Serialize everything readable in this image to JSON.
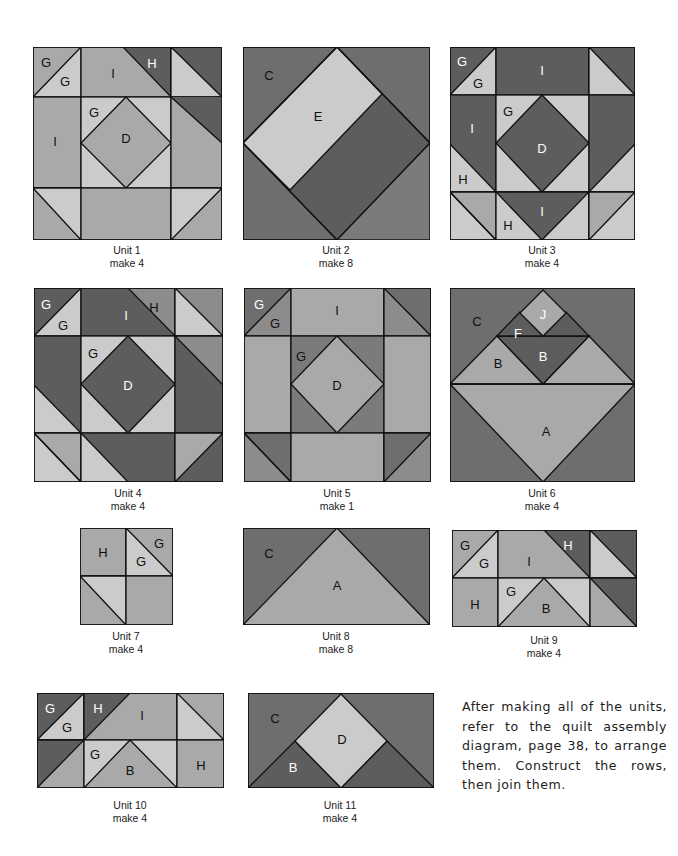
{
  "colors": {
    "light": "#cbcbcb",
    "medium": "#a9a9a9",
    "mid_dark": "#8c8c8c",
    "dark": "#5d5d5d",
    "outline": "#111111"
  },
  "units": [
    {
      "id": 1,
      "title": "Unit 1",
      "quantity": "make 4",
      "piece_labels": [
        "G",
        "G",
        "I",
        "H",
        "G",
        "I",
        "D"
      ]
    },
    {
      "id": 2,
      "title": "Unit 2",
      "quantity": "make 8",
      "piece_labels": [
        "C",
        "E"
      ]
    },
    {
      "id": 3,
      "title": "Unit 3",
      "quantity": "make 4",
      "piece_labels": [
        "G",
        "G",
        "I",
        "G",
        "I",
        "D",
        "H",
        "H",
        "I"
      ]
    },
    {
      "id": 4,
      "title": "Unit 4",
      "quantity": "make 4",
      "piece_labels": [
        "G",
        "G",
        "I",
        "H",
        "G",
        "D"
      ]
    },
    {
      "id": 5,
      "title": "Unit 5",
      "quantity": "make 1",
      "piece_labels": [
        "G",
        "G",
        "I",
        "G",
        "D"
      ]
    },
    {
      "id": 6,
      "title": "Unit 6",
      "quantity": "make 4",
      "piece_labels": [
        "C",
        "J",
        "F",
        "B",
        "B",
        "A"
      ]
    },
    {
      "id": 7,
      "title": "Unit 7",
      "quantity": "make 4",
      "piece_labels": [
        "H",
        "G",
        "G"
      ]
    },
    {
      "id": 8,
      "title": "Unit 8",
      "quantity": "make 8",
      "piece_labels": [
        "C",
        "A"
      ]
    },
    {
      "id": 9,
      "title": "Unit 9",
      "quantity": "make 4",
      "piece_labels": [
        "G",
        "G",
        "I",
        "H",
        "H",
        "G",
        "B"
      ]
    },
    {
      "id": 10,
      "title": "Unit 10",
      "quantity": "make 4",
      "piece_labels": [
        "G",
        "G",
        "H",
        "I",
        "G",
        "B",
        "H"
      ]
    },
    {
      "id": 11,
      "title": "Unit 11",
      "quantity": "make 4",
      "piece_labels": [
        "C",
        "D",
        "B"
      ]
    }
  ],
  "instructions": "After making all of the units, refer to the quilt assembly diagram, page 38, to arrange them. Construct the rows, then join them."
}
